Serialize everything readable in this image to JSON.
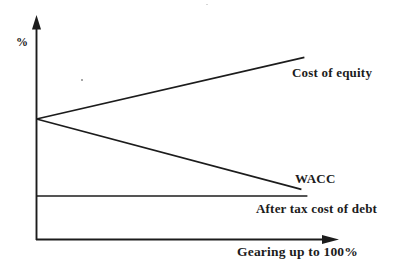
{
  "figure": {
    "background": "#ffffff",
    "ink_color": "#1c1c1c"
  },
  "axes": {
    "y_label": "%",
    "x_label": "Gearing up to 100%"
  },
  "labels": {
    "cost_of_equity": "Cost of equity",
    "wacc": "WACC",
    "after_tax_cost_of_debt": "After tax cost of debt"
  },
  "chart_data": {
    "type": "line",
    "title": "",
    "xlabel": "Gearing up to 100%",
    "ylabel": "%",
    "grid": false,
    "legend_position": "inline-right-of-lines",
    "axis_style": "arrowed, no tick marks, qualitative (values are relative 0-100 positions along each axis)",
    "xlim": [
      0,
      100
    ],
    "ylim": [
      0,
      100
    ],
    "series": [
      {
        "name": "Cost of equity",
        "trend": "rising",
        "x": [
          0,
          89
        ],
        "y": [
          55,
          83
        ]
      },
      {
        "name": "WACC",
        "trend": "falling",
        "x": [
          0,
          88
        ],
        "y": [
          55,
          23
        ]
      },
      {
        "name": "After tax cost of debt",
        "trend": "flat",
        "x": [
          0,
          90
        ],
        "y": [
          20,
          20
        ]
      }
    ]
  }
}
